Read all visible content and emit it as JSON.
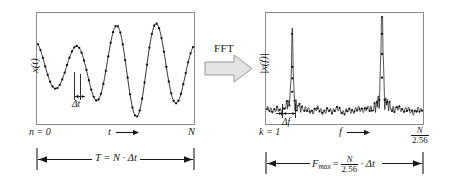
{
  "figure": {
    "transform_label": "FFT",
    "colors": {
      "line": "#1a1a1a",
      "marker": "#111111",
      "frame": "#808080",
      "arrow_fill": "#e3e3e3",
      "arrow_stroke": "#9a9a9a",
      "background": "#ffffff"
    }
  },
  "time_panel": {
    "name": "time-domain-plot",
    "ylabel": "x(t)",
    "xlabel": "t",
    "x_start_label": "n = 0",
    "x_end_label": "N",
    "sample_interval_label": "Δt",
    "span_label_prefix": "T = N",
    "span_label_mid": "·",
    "span_label_suffix": "Δt",
    "span_label_full": "T = N · Δt"
  },
  "freq_panel": {
    "name": "frequency-domain-plot",
    "ylabel": "|x(f)|",
    "xlabel": "f",
    "x_start_label": "k = 1",
    "x_end_numerator": "N",
    "x_end_denominator": "2.56",
    "line_spacing_label": "Δf",
    "span_label_prefix": "F",
    "span_label_sub": "max",
    "span_label_eq": "=",
    "span_label_numerator": "N",
    "span_label_denominator": "2.56",
    "span_label_dot": "·",
    "span_label_suffix": "Δt",
    "span_label_full": "F_max = N/2.56 · Δt"
  },
  "chart_data": {
    "type": "line",
    "charts": [
      {
        "id": "time-domain",
        "type": "line",
        "xlabel": "t",
        "ylabel": "x(t)",
        "grid": false,
        "legend": "none",
        "xlim": [
          0,
          1
        ],
        "ylim": [
          -1.15,
          1.15
        ],
        "x_tick_labels": [
          "n = 0",
          "N"
        ],
        "annotations": [
          "Δt",
          "T = N · Δt"
        ],
        "description": "Amplitude-modulated (beat) sine wave, approximately 4 cycles across the record, sampled at discrete points shown as dots.",
        "n_samples": 64,
        "series": [
          {
            "name": "x(t)",
            "formula": "cos(2*pi*3.85*x + 0.35) * (0.72 + 0.30*cos(2*pi*1.0*x + 2.2))",
            "marker": "dot"
          }
        ]
      },
      {
        "id": "frequency-domain",
        "type": "line",
        "xlabel": "f",
        "ylabel": "|x(f)|",
        "grid": false,
        "legend": "none",
        "xlim": [
          0,
          1
        ],
        "ylim": [
          0,
          1.05
        ],
        "x_tick_labels": [
          "k = 1",
          "N/2.56"
        ],
        "annotations": [
          "Δf",
          "F_max = N/2.56 · Δt"
        ],
        "description": "Magnitude spectrum with a noise floor near 0.12 and two narrow spectral peaks: a smaller peak at about f=0.16 with height 0.62, and a dominant peak at about f=0.74 with height 1.00. Each peak has leakage sidelobes decaying to the noise floor.",
        "noise_floor": 0.12,
        "peaks": [
          {
            "x": 0.163,
            "height": 0.62,
            "label": "first line"
          },
          {
            "x": 0.742,
            "height": 1.0,
            "label": "second line"
          }
        ]
      }
    ]
  }
}
